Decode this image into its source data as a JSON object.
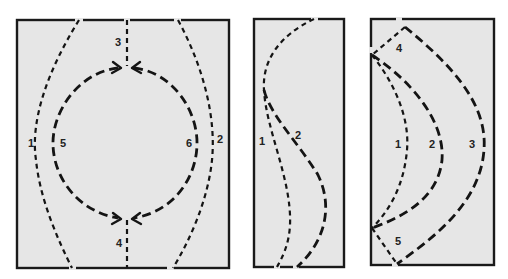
{
  "figure": {
    "panels": [
      {
        "id": "panel-1",
        "description": "Rectangle with two outer bowed dashed curves and a dashed circle with arrows converging at top and bottom center",
        "labels": [
          "1",
          "2",
          "3",
          "4",
          "5",
          "6"
        ]
      },
      {
        "id": "panel-2",
        "description": "Narrow rectangle with two S-shaped dashed curves",
        "labels": [
          "1",
          "2"
        ]
      },
      {
        "id": "panel-3",
        "description": "Rectangle with three nested crescent dashed curves meeting at the left edge",
        "labels": [
          "1",
          "2",
          "3",
          "4",
          "5"
        ]
      }
    ]
  },
  "labels": {
    "p1": {
      "l1": "1",
      "l2": "2",
      "l3": "3",
      "l4": "4",
      "l5": "5",
      "l6": "6"
    },
    "p2": {
      "l1": "1",
      "l2": "2"
    },
    "p3": {
      "l1": "1",
      "l2": "2",
      "l3": "3",
      "l4": "4",
      "l5": "5"
    }
  },
  "colors": {
    "panel_fill": "#e6e6e6",
    "line": "#141414",
    "background": "#ffffff"
  }
}
